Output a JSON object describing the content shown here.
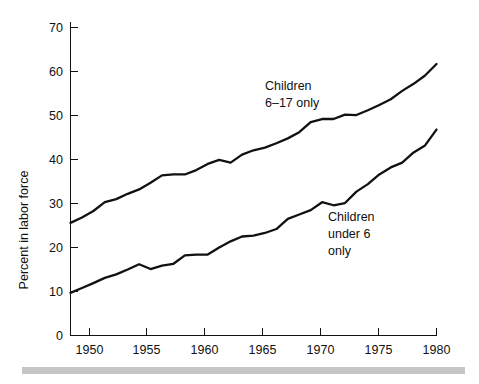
{
  "chart_data": {
    "type": "line",
    "title": "",
    "xlabel": "",
    "ylabel": "Percent in labor force",
    "xlim": [
      1948,
      1980
    ],
    "ylim": [
      0,
      70
    ],
    "grid": false,
    "legend_position": "inline-annotation",
    "xticks": [
      1950,
      1955,
      1960,
      1965,
      1970,
      1975,
      1980
    ],
    "xtick_labels": [
      "1950",
      "1955",
      "1960",
      "1965",
      "1970",
      "1975",
      "1980"
    ],
    "yticks": [
      0,
      10,
      20,
      30,
      40,
      50,
      60,
      70
    ],
    "ytick_labels": [
      "0",
      "10",
      "20",
      "30",
      "40",
      "50",
      "60",
      "70"
    ],
    "x": [
      1948,
      1949,
      1950,
      1951,
      1952,
      1953,
      1954,
      1955,
      1956,
      1957,
      1958,
      1959,
      1960,
      1961,
      1962,
      1963,
      1964,
      1965,
      1966,
      1967,
      1968,
      1969,
      1970,
      1971,
      1972,
      1973,
      1974,
      1975,
      1976,
      1977,
      1978,
      1979,
      1980
    ],
    "series": [
      {
        "name": "Children 6-17 only",
        "label": "Children\n6–17 only",
        "color": "#111111",
        "values": [
          25.6,
          26.8,
          28.3,
          30.3,
          31.0,
          32.2,
          33.2,
          34.7,
          36.4,
          36.6,
          36.6,
          37.6,
          39.0,
          39.9,
          39.3,
          41.1,
          42.1,
          42.7,
          43.7,
          44.8,
          46.2,
          48.5,
          49.2,
          49.2,
          50.2,
          50.1,
          51.2,
          52.4,
          53.7,
          55.6,
          57.2,
          59.1,
          61.7
        ]
      },
      {
        "name": "Children under 6 only",
        "label": "Children\nunder 6\nonly",
        "color": "#111111",
        "values": [
          9.7,
          10.8,
          11.9,
          13.1,
          13.9,
          15.0,
          16.2,
          15.1,
          15.9,
          16.3,
          18.2,
          18.4,
          18.4,
          20.0,
          21.4,
          22.5,
          22.7,
          23.3,
          24.2,
          26.5,
          27.5,
          28.5,
          30.3,
          29.6,
          30.1,
          32.7,
          34.4,
          36.6,
          38.2,
          39.3,
          41.6,
          43.2,
          46.8
        ]
      }
    ]
  },
  "annotations": [
    {
      "name": "upper-series-label",
      "line1": "Children",
      "line2": "6–17 only"
    },
    {
      "name": "lower-series-label",
      "line1": "Children",
      "line2": "under 6",
      "line3": "only"
    }
  ],
  "axes": {
    "y_axis_title": "Percent in labor force"
  },
  "colors": {
    "line": "#111111",
    "axis": "#111111",
    "text": "#111111",
    "footer_bar": "#c6c6c6",
    "background": "#ffffff"
  }
}
